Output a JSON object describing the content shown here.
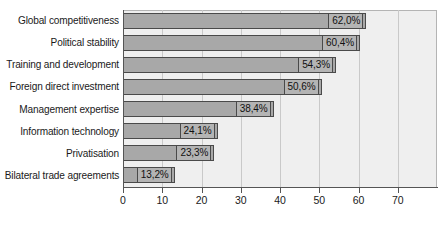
{
  "chart_data": {
    "type": "bar",
    "orientation": "horizontal",
    "title": "",
    "xlabel": "",
    "ylabel": "",
    "xlim": [
      0,
      80
    ],
    "grid": true,
    "legend": false,
    "categories": [
      "Global competitiveness",
      "Political stability",
      "Training and development",
      "Foreign direct investment",
      "Management expertise",
      "Information technology",
      "Privatisation",
      "Bilateral trade agreements"
    ],
    "values": [
      62.0,
      60.4,
      54.3,
      50.6,
      38.4,
      24.1,
      23.3,
      13.2
    ],
    "value_labels": [
      "62,0%",
      "60,4%",
      "54,3%",
      "50,6%",
      "38,4%",
      "24,1%",
      "23,3%",
      "13,2%"
    ],
    "xticks": [
      0,
      10,
      20,
      30,
      40,
      50,
      60,
      70
    ],
    "xtick_labels": [
      "0",
      "10",
      "20",
      "30",
      "40",
      "50",
      "60",
      "70"
    ],
    "colors": {
      "bar_fill": "#a8a8a8",
      "bar_border": "#4a4a4a",
      "plot_background": "#efefef",
      "gridline": "#c9c9c9",
      "axis": "#555555",
      "text": "#1a1a1a",
      "label_box_fill": "#b4b4b4"
    }
  }
}
